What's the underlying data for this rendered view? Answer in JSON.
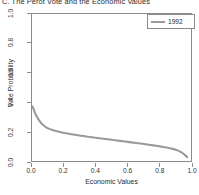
{
  "chart_data": {
    "type": "line",
    "title": "C. The Perot Vote and the Economic Values",
    "xlabel": "Economic Values",
    "ylabel": "Vote Probability",
    "xlim": [
      0.0,
      1.0
    ],
    "ylim": [
      0.0,
      1.0
    ],
    "grid": false,
    "legend_position": "top-right",
    "line_color": "#9a9a9a",
    "series": [
      {
        "name": "1992",
        "color": "#9a9a9a",
        "x": [
          0.01,
          0.025,
          0.04,
          0.055,
          0.07,
          0.09,
          0.11,
          0.13,
          0.16,
          0.2,
          0.25,
          0.3,
          0.35,
          0.4,
          0.45,
          0.5,
          0.55,
          0.6,
          0.65,
          0.7,
          0.75,
          0.8,
          0.85,
          0.88,
          0.91,
          0.935,
          0.955,
          0.97
        ],
        "y": [
          0.372,
          0.33,
          0.297,
          0.272,
          0.253,
          0.236,
          0.224,
          0.216,
          0.206,
          0.196,
          0.186,
          0.178,
          0.17,
          0.163,
          0.156,
          0.149,
          0.142,
          0.135,
          0.128,
          0.121,
          0.113,
          0.105,
          0.095,
          0.088,
          0.078,
          0.065,
          0.048,
          0.032
        ]
      }
    ],
    "xticks": [
      {
        "value": 0.0,
        "label": "0.0"
      },
      {
        "value": 0.2,
        "label": "0.2"
      },
      {
        "value": 0.4,
        "label": "0.4"
      },
      {
        "value": 0.6,
        "label": "0.6"
      },
      {
        "value": 0.8,
        "label": "0.8"
      },
      {
        "value": 1.0,
        "label": "1.0"
      }
    ],
    "yticks": [
      {
        "value": 0.0,
        "label": "0.0"
      },
      {
        "value": 0.2,
        "label": "0.2"
      },
      {
        "value": 0.4,
        "label": "0.4"
      },
      {
        "value": 0.6,
        "label": "0.6"
      },
      {
        "value": 0.8,
        "label": "0.8"
      },
      {
        "value": 1.0,
        "label": "1.0"
      }
    ],
    "legend": [
      {
        "label": "1992",
        "color": "#9a9a9a"
      }
    ]
  }
}
